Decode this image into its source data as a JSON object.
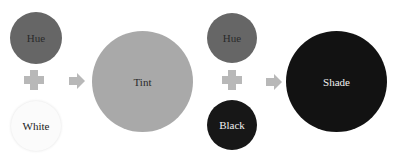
{
  "colors": {
    "hue": "#666666",
    "tint": "#a9a9a9",
    "white": "#fbfbfb",
    "black": "#171717",
    "shade": "#121212",
    "operator": "#b8b8b8"
  },
  "left_group": {
    "hue_label": "Hue",
    "white_label": "White",
    "result_label": "Tint",
    "operator": "plus",
    "flow": "arrow-right"
  },
  "right_group": {
    "hue_label": "Hue",
    "black_label": "Black",
    "result_label": "Shade",
    "operator": "plus",
    "flow": "arrow-right"
  }
}
